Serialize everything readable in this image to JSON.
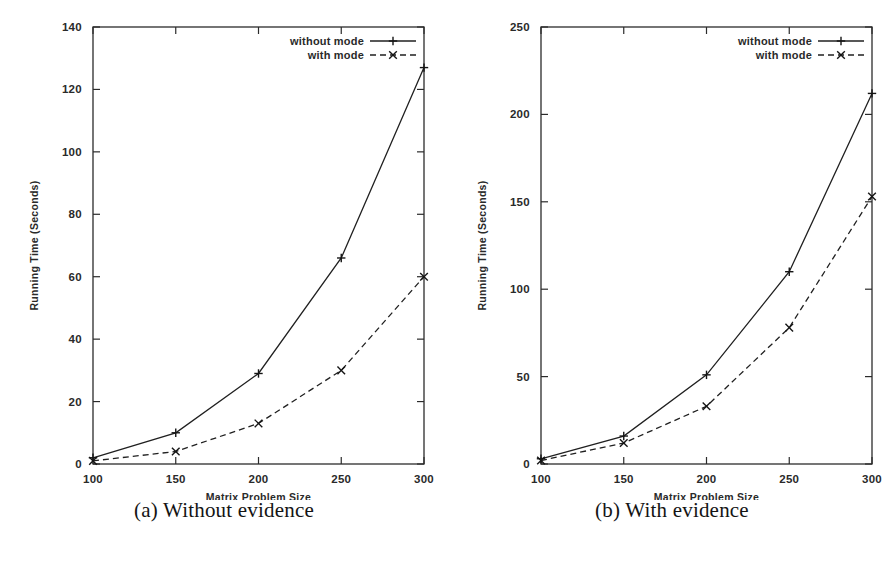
{
  "figure": {
    "panels": [
      {
        "id": "panel-a",
        "caption": "(a) Without evidence",
        "chart_data": {
          "type": "line",
          "title": "",
          "xlabel": "Matrix Problem Size",
          "ylabel": "Running Time (Seconds)",
          "x": [
            100,
            150,
            200,
            250,
            300
          ],
          "xticklabels": [
            "100",
            "150",
            "200",
            "250",
            "300"
          ],
          "yticklabels": [
            "0",
            "20",
            "40",
            "60",
            "80",
            "100",
            "120",
            "140"
          ],
          "yticks": [
            0,
            20,
            40,
            60,
            80,
            100,
            120,
            140
          ],
          "xlim": [
            100,
            300
          ],
          "ylim": [
            0,
            140
          ],
          "grid": false,
          "legend_position": "top-right",
          "series": [
            {
              "name": "without mode",
              "style": "solid",
              "marker": "plus",
              "values": [
                2,
                10,
                29,
                66,
                127
              ]
            },
            {
              "name": "with mode",
              "style": "dashed",
              "marker": "cross",
              "values": [
                1,
                4,
                13,
                30,
                60
              ]
            }
          ]
        }
      },
      {
        "id": "panel-b",
        "caption": "(b) With evidence",
        "chart_data": {
          "type": "line",
          "title": "",
          "xlabel": "Matrix Problem Size",
          "ylabel": "Running Time (Seconds)",
          "x": [
            100,
            150,
            200,
            250,
            300
          ],
          "xticklabels": [
            "100",
            "150",
            "200",
            "250",
            "300"
          ],
          "yticklabels": [
            "0",
            "50",
            "100",
            "150",
            "200",
            "250"
          ],
          "yticks": [
            0,
            50,
            100,
            150,
            200,
            250
          ],
          "xlim": [
            100,
            300
          ],
          "ylim": [
            0,
            250
          ],
          "grid": false,
          "legend_position": "top-right",
          "series": [
            {
              "name": "without mode",
              "style": "solid",
              "marker": "plus",
              "values": [
                3,
                16,
                51,
                110,
                212
              ]
            },
            {
              "name": "with mode",
              "style": "dashed",
              "marker": "cross",
              "values": [
                2,
                12,
                33,
                78,
                153
              ]
            }
          ]
        }
      }
    ]
  },
  "colors": {
    "ink": "#202020",
    "background": "#ffffff"
  }
}
